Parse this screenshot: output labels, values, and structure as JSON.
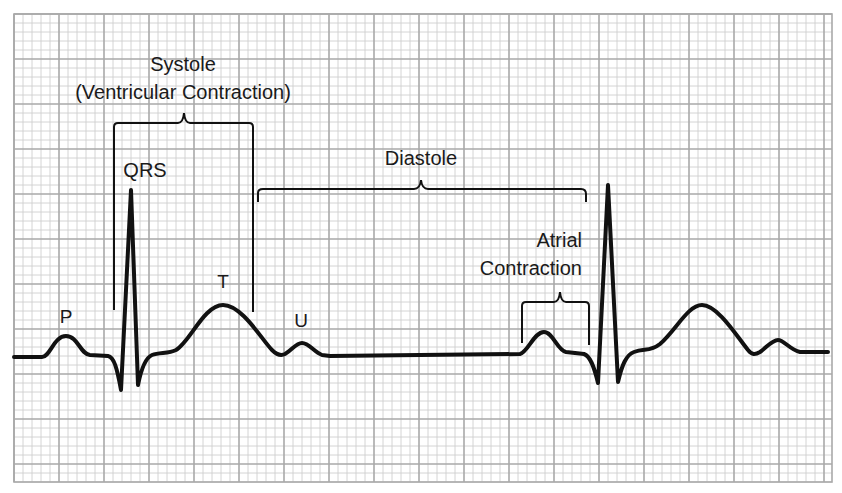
{
  "diagram": {
    "grid": {
      "x0": 14,
      "y0": 14,
      "x1": 832,
      "y1": 482,
      "minor": 9,
      "major": 45,
      "minor_color": "#cfcfcf",
      "major_color": "#a9a9a9"
    },
    "trace_color": "#111111",
    "labels": {
      "systole": "Systole",
      "systole_sub": "(Ventricular Contraction)",
      "qrs": "QRS",
      "diastole": "Diastole",
      "atrial": "Atrial",
      "atrial_sub": "Contraction",
      "p": "P",
      "t": "T",
      "u": "U"
    },
    "waves": [
      {
        "name": "P",
        "x": 67,
        "y": 336
      },
      {
        "name": "Q",
        "x": 121,
        "y": 390
      },
      {
        "name": "R",
        "x": 131,
        "y": 190
      },
      {
        "name": "S",
        "x": 138,
        "y": 385
      },
      {
        "name": "T",
        "x": 223,
        "y": 305
      },
      {
        "name": "U",
        "x": 302,
        "y": 343
      },
      {
        "name": "P (atrial contraction)",
        "x": 544,
        "y": 332
      },
      {
        "name": "Q",
        "x": 598,
        "y": 383
      },
      {
        "name": "R",
        "x": 608,
        "y": 185
      },
      {
        "name": "S",
        "x": 618,
        "y": 382
      },
      {
        "name": "T",
        "x": 702,
        "y": 305
      },
      {
        "name": "U",
        "x": 778,
        "y": 340
      }
    ],
    "brackets": [
      {
        "name": "systole",
        "x_start": 114,
        "x_end": 253,
        "y_top": 123,
        "y_bottom": 310
      },
      {
        "name": "diastole",
        "x_start": 258,
        "x_end": 586,
        "y_top": 189,
        "y_bottom": 202
      },
      {
        "name": "atrial-contraction",
        "x_start": 522,
        "x_end": 589,
        "y_top": 302,
        "y_bottom": 343
      }
    ]
  }
}
